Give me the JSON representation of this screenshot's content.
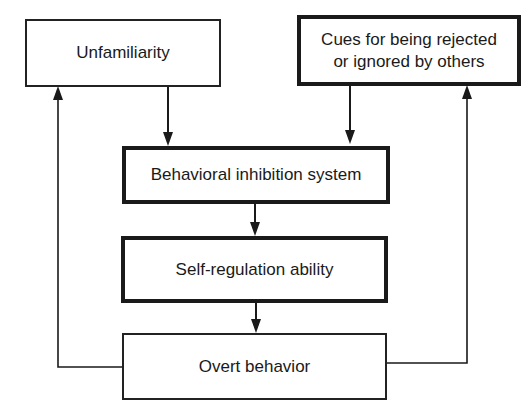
{
  "diagram": {
    "nodes": {
      "unfamiliarity": {
        "label": "Unfamiliarity"
      },
      "cues": {
        "label": "Cues for being rejected or ignored by others",
        "line1": "Cues for being rejected",
        "line2": "or ignored by others"
      },
      "bis": {
        "label": "Behavioral inhibition system"
      },
      "self_regulation": {
        "label": "Self-regulation ability"
      },
      "overt_behavior": {
        "label": "Overt behavior"
      }
    },
    "edges": [
      {
        "from": "Unfamiliarity",
        "to": "Behavioral inhibition system"
      },
      {
        "from": "Cues for being rejected or ignored by others",
        "to": "Behavioral inhibition system"
      },
      {
        "from": "Behavioral inhibition system",
        "to": "Self-regulation ability"
      },
      {
        "from": "Self-regulation ability",
        "to": "Overt behavior"
      },
      {
        "from": "Overt behavior",
        "to": "Unfamiliarity"
      },
      {
        "from": "Overt behavior",
        "to": "Cues for being rejected or ignored by others"
      }
    ]
  }
}
